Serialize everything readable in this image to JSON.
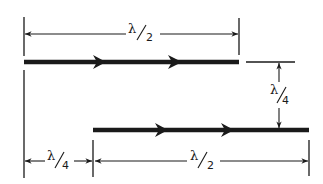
{
  "diagram": {
    "colors": {
      "ink": "#1a1a1a",
      "background": "#ffffff"
    },
    "conductors": [
      {
        "id": "upper",
        "x1": 24,
        "x2": 239,
        "y": 62,
        "direction": "right",
        "arrow_tips": [
          105,
          181
        ]
      },
      {
        "id": "lower",
        "x1": 93,
        "x2": 309,
        "y": 130,
        "direction": "right",
        "arrow_tips": [
          166,
          232
        ]
      }
    ],
    "dimensions": [
      {
        "id": "upper-length",
        "label_num": "λ",
        "label_den": "2",
        "orientation": "horizontal",
        "from": 24,
        "to": 239,
        "at": 34
      },
      {
        "id": "vertical-spacing",
        "label_num": "λ",
        "label_den": "4",
        "orientation": "vertical",
        "from": 62,
        "to": 130,
        "at": 279
      },
      {
        "id": "horizontal-offset",
        "label_num": "λ",
        "label_den": "4",
        "orientation": "horizontal",
        "from": 24,
        "to": 93,
        "at": 161
      },
      {
        "id": "lower-length",
        "label_num": "λ",
        "label_den": "2",
        "orientation": "horizontal",
        "from": 93,
        "to": 309,
        "at": 161
      }
    ]
  },
  "labels": {
    "upper_length": {
      "num": "λ",
      "den": "2"
    },
    "vertical_spacing": {
      "num": "λ",
      "den": "4"
    },
    "horizontal_offset": {
      "num": "λ",
      "den": "4"
    },
    "lower_length": {
      "num": "λ",
      "den": "2"
    }
  }
}
